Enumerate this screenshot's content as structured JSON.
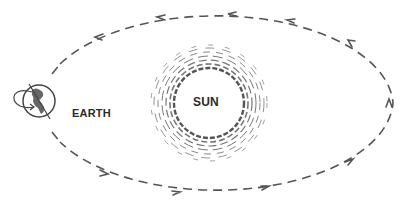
{
  "labels": {
    "sun": "SUN",
    "earth": "EARTH"
  },
  "colors": {
    "background": "#ffffff",
    "line": "#555555",
    "text": "#2a2a2a"
  },
  "orbit": {
    "cx": 217,
    "cy": 103,
    "rx": 177,
    "ry": 91,
    "direction": "counterclockwise",
    "dash": "9 6"
  },
  "sun": {
    "cx": 209,
    "cy": 103,
    "inner_radius": 33,
    "outer_radius": 58
  },
  "earth": {
    "cx": 39,
    "cy": 101,
    "r": 16
  },
  "icons": [
    "orbit-path",
    "direction-arrow",
    "sun-corona",
    "earth-globe",
    "rotation-arrow"
  ]
}
